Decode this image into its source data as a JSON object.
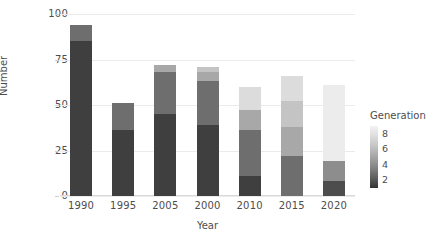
{
  "chart_data": {
    "type": "bar",
    "title": "",
    "xlabel": "Year",
    "ylabel": "Number",
    "stacked": true,
    "grid": true,
    "ylim": [
      0,
      100
    ],
    "yticks": [
      0,
      25,
      50,
      75,
      100
    ],
    "categories": [
      "1990",
      "1995",
      "2005",
      "2000",
      "2010",
      "2015",
      "2020"
    ],
    "legend": {
      "title": "Generation",
      "type": "continuous-colorbar",
      "position": "right",
      "ticks": [
        8,
        6,
        4,
        2
      ],
      "range": [
        1,
        9
      ],
      "gradient_top_color": "#f2f2f2",
      "gradient_bottom_color": "#333333"
    },
    "series": [
      {
        "name": "1",
        "generation": 1,
        "color": "#3f3f3f",
        "values": [
          85,
          36,
          45,
          39,
          11,
          0,
          0
        ]
      },
      {
        "name": "2",
        "generation": 2,
        "color": "#4d4d4d",
        "values": [
          0,
          0,
          0,
          0,
          0,
          0,
          8
        ]
      },
      {
        "name": "3",
        "generation": 3,
        "color": "#6e6e6e",
        "values": [
          9,
          15,
          23,
          24,
          25,
          22,
          0
        ]
      },
      {
        "name": "4",
        "generation": 4,
        "color": "#8d8d8d",
        "values": [
          0,
          0,
          0,
          0,
          0,
          0,
          11
        ]
      },
      {
        "name": "5",
        "generation": 5,
        "color": "#a8a8a8",
        "values": [
          0,
          0,
          4,
          5,
          11,
          16,
          0
        ]
      },
      {
        "name": "6",
        "generation": 6,
        "color": "#c4c4c4",
        "values": [
          0,
          0,
          0,
          3,
          0,
          14,
          0
        ]
      },
      {
        "name": "7",
        "generation": 7,
        "color": "#dcdcdc",
        "values": [
          0,
          0,
          0,
          0,
          13,
          14,
          0
        ]
      },
      {
        "name": "8",
        "generation": 8,
        "color": "#ececec",
        "values": [
          0,
          0,
          0,
          0,
          0,
          0,
          42
        ]
      }
    ],
    "totals": [
      94,
      51,
      72,
      71,
      60,
      66,
      61
    ]
  },
  "axes": {
    "ytick_labels": [
      "100",
      "75",
      "50",
      "25",
      "0"
    ],
    "ylabel_text": "Number",
    "xlabel_text": "Year",
    "xtick_labels": [
      "1990",
      "1995",
      "2005",
      "2000",
      "2010",
      "2015",
      "2020"
    ]
  },
  "legend_panel": {
    "title": "Generation",
    "tick_labels": [
      "8",
      "6",
      "4",
      "2"
    ]
  },
  "colors": {
    "background": "#ffffff",
    "grid": "#ebebeb",
    "text": "#4d4d4d"
  }
}
